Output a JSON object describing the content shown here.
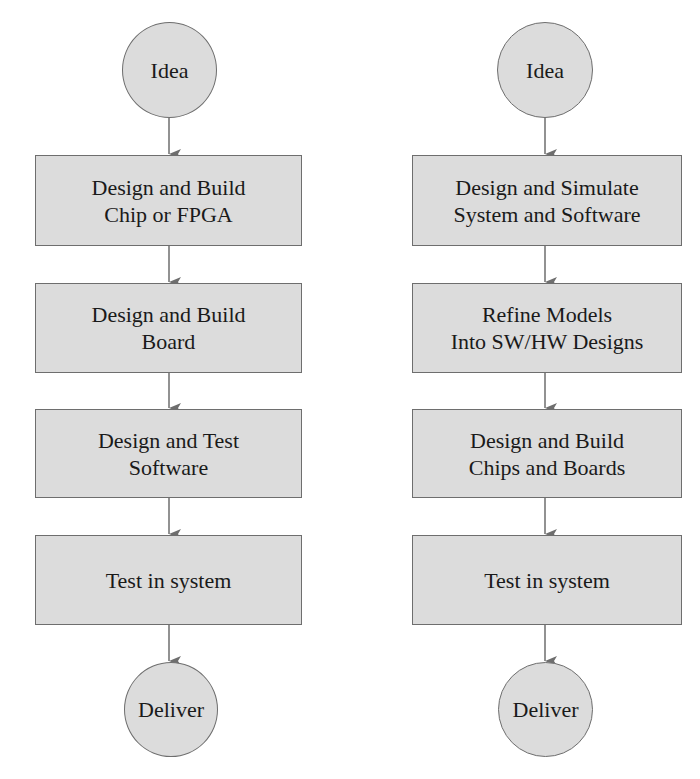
{
  "diagram": {
    "colors": {
      "fill": "#dcdcdc",
      "stroke": "#6e6e6e",
      "text": "#1a1a1a",
      "background": "#ffffff"
    },
    "left_flow": {
      "start": {
        "shape": "circle",
        "label": "Idea"
      },
      "steps": [
        {
          "shape": "rect",
          "lines": [
            "Design and Build",
            "Chip or FPGA"
          ]
        },
        {
          "shape": "rect",
          "lines": [
            "Design and Build",
            "Board"
          ]
        },
        {
          "shape": "rect",
          "lines": [
            "Design and Test",
            "Software"
          ]
        },
        {
          "shape": "rect",
          "lines": [
            "Test in system"
          ]
        }
      ],
      "end": {
        "shape": "circle",
        "label": "Deliver"
      }
    },
    "right_flow": {
      "start": {
        "shape": "circle",
        "label": "Idea"
      },
      "steps": [
        {
          "shape": "rect",
          "lines": [
            "Design and Simulate",
            "System and Software"
          ]
        },
        {
          "shape": "rect",
          "lines": [
            "Refine Models",
            "Into SW/HW Designs"
          ]
        },
        {
          "shape": "rect",
          "lines": [
            "Design and Build",
            "Chips and Boards"
          ]
        },
        {
          "shape": "rect",
          "lines": [
            "Test in system"
          ]
        }
      ],
      "end": {
        "shape": "circle",
        "label": "Deliver"
      }
    },
    "edges": [
      {
        "flow": "left",
        "from": "Idea",
        "to": "Design and Build Chip or FPGA"
      },
      {
        "flow": "left",
        "from": "Design and Build Chip or FPGA",
        "to": "Design and Build Board"
      },
      {
        "flow": "left",
        "from": "Design and Build Board",
        "to": "Design and Test Software"
      },
      {
        "flow": "left",
        "from": "Design and Test Software",
        "to": "Test in system"
      },
      {
        "flow": "left",
        "from": "Test in system",
        "to": "Deliver"
      },
      {
        "flow": "right",
        "from": "Idea",
        "to": "Design and Simulate System and Software"
      },
      {
        "flow": "right",
        "from": "Design and Simulate System and Software",
        "to": "Refine Models Into SW/HW Designs"
      },
      {
        "flow": "right",
        "from": "Refine Models Into SW/HW Designs",
        "to": "Design and Build Chips and Boards"
      },
      {
        "flow": "right",
        "from": "Design and Build Chips and Boards",
        "to": "Test in system"
      },
      {
        "flow": "right",
        "from": "Test in system",
        "to": "Deliver"
      }
    ]
  }
}
